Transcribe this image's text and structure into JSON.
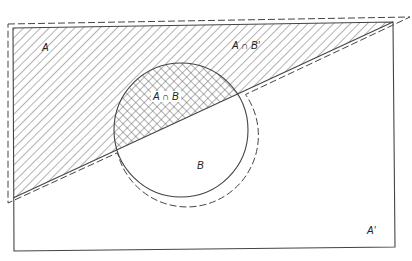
{
  "diagram": {
    "type": "venn",
    "colors": {
      "stroke": "#444444",
      "hatch": "#555555",
      "background": "#ffffff"
    },
    "labels": {
      "A": "A",
      "A_intersect_B_complement": "A ∩ B′",
      "A_intersect_B": "A ∩ B",
      "B": "B",
      "A_complement": "A′"
    },
    "regions": [
      {
        "id": "A",
        "shading": "diagonal-hatch"
      },
      {
        "id": "A ∩ B",
        "shading": "cross-hatch"
      },
      {
        "id": "B",
        "shading": "none"
      },
      {
        "id": "A′",
        "shading": "none"
      }
    ],
    "outline": "dashed boundary around A ∪ B"
  }
}
